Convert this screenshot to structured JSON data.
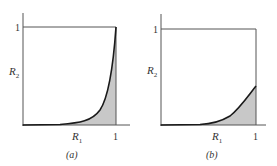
{
  "figure": {
    "panels": [
      {
        "id": "a",
        "caption": "(a)",
        "y_axis_label": "R",
        "y_axis_subscript": "2",
        "x_axis_label": "R",
        "x_axis_subscript": "1",
        "y_tick": "1",
        "x_tick": "1",
        "curve_end_value": 1.0
      },
      {
        "id": "b",
        "caption": "(b)",
        "y_axis_label": "R",
        "y_axis_subscript": "2",
        "x_axis_label": "R",
        "x_axis_subscript": "1",
        "y_tick": "1",
        "x_tick": "1",
        "curve_end_value": 0.4
      }
    ],
    "colors": {
      "axis": "#555555",
      "curve": "#1a1a1a",
      "fill": "#c8c8c8",
      "text": "#333333"
    }
  }
}
